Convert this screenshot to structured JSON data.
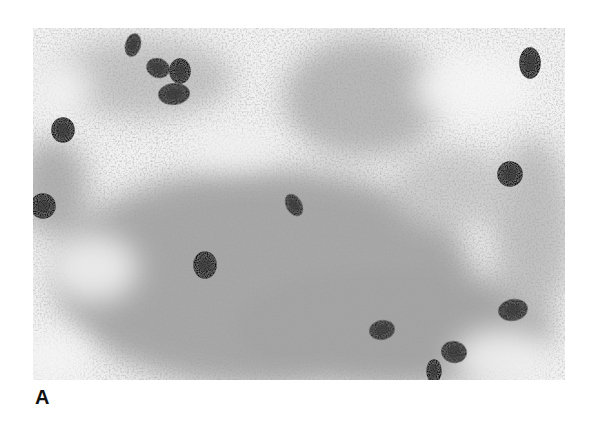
{
  "figure": {
    "panel_label": "A",
    "image_description": "Grayscale light micrograph of a fecal smear showing numerous dark oval parasite eggs scattered over granular debris",
    "colors": {
      "background": "#ffffff",
      "field_light": "#f2f2f2",
      "debris": "#9a9a9a",
      "egg": "#1e1e1e"
    },
    "eggs": [
      {
        "cx": 100,
        "cy": 17,
        "rx": 7,
        "ry": 11,
        "rot": 15
      },
      {
        "cx": 125,
        "cy": 40,
        "rx": 11,
        "ry": 9,
        "rot": 20
      },
      {
        "cx": 147,
        "cy": 43,
        "rx": 10,
        "ry": 12,
        "rot": 0
      },
      {
        "cx": 141,
        "cy": 66,
        "rx": 15,
        "ry": 10,
        "rot": -5
      },
      {
        "cx": 30,
        "cy": 102,
        "rx": 11,
        "ry": 12,
        "rot": 0
      },
      {
        "cx": 497,
        "cy": 35,
        "rx": 10,
        "ry": 15,
        "rot": 0
      },
      {
        "cx": 477,
        "cy": 146,
        "rx": 12,
        "ry": 12,
        "rot": 0
      },
      {
        "cx": 261,
        "cy": 177,
        "rx": 7,
        "ry": 11,
        "rot": -30
      },
      {
        "cx": 172,
        "cy": 237,
        "rx": 11,
        "ry": 13,
        "rot": 0
      },
      {
        "cx": 349,
        "cy": 302,
        "rx": 12,
        "ry": 9,
        "rot": -10
      },
      {
        "cx": 480,
        "cy": 282,
        "rx": 14,
        "ry": 10,
        "rot": -10
      },
      {
        "cx": 421,
        "cy": 324,
        "rx": 12,
        "ry": 10,
        "rot": 10
      },
      {
        "cx": 401,
        "cy": 343,
        "rx": 7,
        "ry": 11,
        "rot": 0
      },
      {
        "cx": 10,
        "cy": 178,
        "rx": 12,
        "ry": 12,
        "rot": 0
      }
    ]
  }
}
